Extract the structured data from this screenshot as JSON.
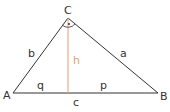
{
  "diagram": {
    "type": "right-triangle-altitude",
    "colors": {
      "line": "#333333",
      "altitude": "#e0a070",
      "background": "#ffffff"
    },
    "vertices": {
      "A": {
        "label": "A",
        "x": 13,
        "y": 93
      },
      "B": {
        "label": "B",
        "x": 158,
        "y": 93
      },
      "C": {
        "label": "C",
        "x": 68,
        "y": 18
      }
    },
    "foot": {
      "x": 68,
      "y": 93
    },
    "labels": {
      "a": "a",
      "b": "b",
      "c": "c",
      "h": "h",
      "p": "p",
      "q": "q"
    },
    "right_angle_marker": "dot"
  }
}
